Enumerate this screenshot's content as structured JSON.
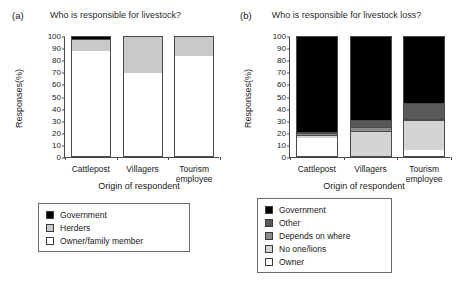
{
  "figure": {
    "width": 462,
    "height": 286,
    "background": "#ffffff"
  },
  "colors": {
    "government": "#000000",
    "other": "#595959",
    "depends_on_where": "#8c8c8c",
    "no_one_lions": "#d4d4d4",
    "owner": "#ffffff",
    "herders": "#c9c9c9",
    "axis": "#4a4a4a",
    "text": "#1a1a1a"
  },
  "panel_a": {
    "tag": "(a)",
    "title": "Who is responsible for livestock?",
    "ylabel": "Responses(%)",
    "xlabel": "Origin of respondent",
    "yticks": [
      "0",
      "10",
      "20",
      "30",
      "40",
      "50",
      "60",
      "70",
      "80",
      "90",
      "100"
    ],
    "categories": [
      "Cattlepost",
      "Villagers",
      "Tourism employee"
    ],
    "category_lines": [
      [
        "Cattlepost"
      ],
      [
        "Villagers"
      ],
      [
        "Tourism",
        "employee"
      ]
    ],
    "legend_title": "Origin of respondent",
    "legend": [
      {
        "label": "Government",
        "color": "#000000"
      },
      {
        "label": "Herders",
        "color": "#c9c9c9"
      },
      {
        "label": "Owner/family member",
        "color": "#ffffff"
      }
    ]
  },
  "panel_b": {
    "tag": "(b)",
    "title": "Who is responsible for livestock loss?",
    "ylabel": "Responses(%)",
    "xlabel": "Origin of respondent",
    "yticks": [
      "0",
      "10",
      "20",
      "30",
      "40",
      "50",
      "60",
      "70",
      "80",
      "90",
      "100"
    ],
    "categories": [
      "Cattlepost",
      "Villagers",
      "Tourism employee"
    ],
    "category_lines": [
      [
        "Cattlepost"
      ],
      [
        "Villagers"
      ],
      [
        "Tourism",
        "employee"
      ]
    ],
    "legend_title": "Origin of respondent",
    "legend": [
      {
        "label": "Government",
        "color": "#000000"
      },
      {
        "label": "Other",
        "color": "#595959"
      },
      {
        "label": "Depends on where",
        "color": "#8c8c8c"
      },
      {
        "label": "No one/lions",
        "color": "#d4d4d4"
      },
      {
        "label": "Owner",
        "color": "#ffffff"
      }
    ]
  },
  "chart_data": [
    {
      "type": "bar",
      "subtype": "stacked",
      "panel": "(a)",
      "title": "Who is responsible for livestock?",
      "xlabel": "Origin of respondent",
      "ylabel": "Responses(%)",
      "ylim": [
        0,
        100
      ],
      "yticks": [
        0,
        10,
        20,
        30,
        40,
        50,
        60,
        70,
        80,
        90,
        100
      ],
      "grid": false,
      "legend_position": "below",
      "categories": [
        "Cattlepost",
        "Villagers",
        "Tourism employee"
      ],
      "series": [
        {
          "name": "Owner/family member",
          "color": "#ffffff",
          "values": [
            87,
            69,
            83
          ]
        },
        {
          "name": "Herders",
          "color": "#c9c9c9",
          "values": [
            10,
            31,
            17
          ]
        },
        {
          "name": "Government",
          "color": "#000000",
          "values": [
            3,
            0,
            0
          ]
        }
      ]
    },
    {
      "type": "bar",
      "subtype": "stacked",
      "panel": "(b)",
      "title": "Who is responsible for livestock loss?",
      "xlabel": "Origin of respondent",
      "ylabel": "Responses(%)",
      "ylim": [
        0,
        100
      ],
      "yticks": [
        0,
        10,
        20,
        30,
        40,
        50,
        60,
        70,
        80,
        90,
        100
      ],
      "grid": false,
      "legend_position": "below",
      "categories": [
        "Cattlepost",
        "Villagers",
        "Tourism employee"
      ],
      "series": [
        {
          "name": "Owner",
          "color": "#ffffff",
          "values": [
            15,
            0,
            5
          ]
        },
        {
          "name": "No one/lions",
          "color": "#d4d4d4",
          "values": [
            2,
            21,
            25
          ]
        },
        {
          "name": "Depends on where",
          "color": "#8c8c8c",
          "values": [
            2,
            3,
            1
          ]
        },
        {
          "name": "Other",
          "color": "#595959",
          "values": [
            1,
            6,
            13
          ]
        },
        {
          "name": "Government",
          "color": "#000000",
          "values": [
            80,
            70,
            56
          ]
        }
      ]
    }
  ]
}
